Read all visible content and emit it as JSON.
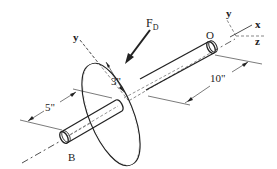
{
  "diagram": {
    "type": "shaft-disk-3d",
    "labels": {
      "force": "F",
      "force_sub": "D",
      "point_o": "O",
      "point_b": "B",
      "axis_y_disk": "y",
      "axis_x": "x",
      "axis_y": "y",
      "axis_z": "z",
      "dim_radius": "3\"",
      "dim_left": "5\"",
      "dim_right": "10\""
    },
    "colors": {
      "line": "#222222",
      "background": "#ffffff"
    }
  }
}
